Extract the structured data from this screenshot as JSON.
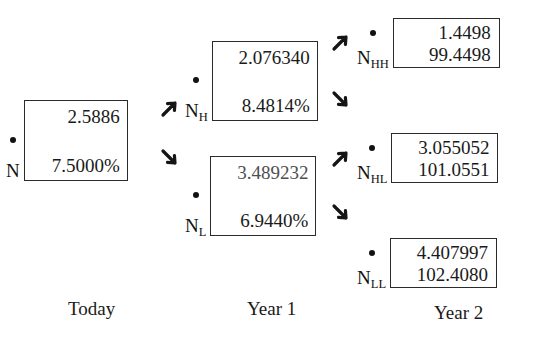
{
  "figure": {
    "type": "binomial-interest-rate-tree",
    "timeline": [
      {
        "id": "today",
        "label": "Today"
      },
      {
        "id": "year1",
        "label": "Year 1"
      },
      {
        "id": "year2",
        "label": "Year 2"
      }
    ],
    "nodes": [
      {
        "id": "N",
        "name": "N",
        "subscript": "",
        "period": "Today",
        "value_top": "2.5886",
        "value_bottom": "7.5000%"
      },
      {
        "id": "NH",
        "name": "N",
        "subscript": "H",
        "period": "Year 1",
        "value_top": "2.076340",
        "value_bottom": "8.4814%"
      },
      {
        "id": "NL",
        "name": "N",
        "subscript": "L",
        "period": "Year 1",
        "value_top": "3.489232",
        "value_bottom": "6.9440%"
      },
      {
        "id": "NHH",
        "name": "N",
        "subscript": "HH",
        "period": "Year 2",
        "value_top": "1.4498",
        "value_bottom": "99.4498"
      },
      {
        "id": "NHL",
        "name": "N",
        "subscript": "HL",
        "period": "Year 2",
        "value_top": "3.055052",
        "value_bottom": "101.0551"
      },
      {
        "id": "NLL",
        "name": "N",
        "subscript": "LL",
        "period": "Year 2",
        "value_top": "4.407997",
        "value_bottom": "102.4080"
      }
    ],
    "edges": [
      {
        "id": "N-to-NH",
        "from": "N",
        "to": "NH",
        "direction": "up"
      },
      {
        "id": "N-to-NL",
        "from": "N",
        "to": "NL",
        "direction": "down"
      },
      {
        "id": "NH-to-NHH",
        "from": "NH",
        "to": "NHH",
        "direction": "up"
      },
      {
        "id": "NH-to-NHL",
        "from": "NH",
        "to": "NHL",
        "direction": "down"
      },
      {
        "id": "NL-to-NHL",
        "from": "NL",
        "to": "NHL",
        "direction": "up"
      },
      {
        "id": "NL-to-NLL",
        "from": "NL",
        "to": "NLL",
        "direction": "down"
      }
    ],
    "colors": {
      "ink": "#1a1a1a",
      "box_border": "#2b2b2b",
      "background": "#ffffff",
      "faded_ink": "#4e4e52"
    }
  }
}
